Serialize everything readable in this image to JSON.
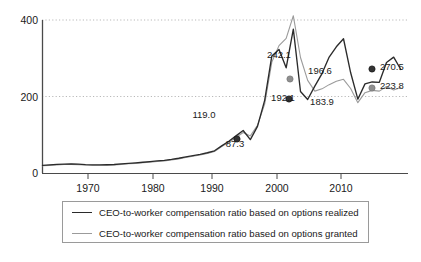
{
  "chart_data": {
    "type": "line",
    "title": "",
    "subtitle": "",
    "xlabel": "",
    "ylabel": "",
    "xlim": [
      1965,
      2016
    ],
    "ylim": [
      0,
      420
    ],
    "yticks": [
      0,
      200,
      400
    ],
    "ytick_labels": [
      "0",
      "200",
      "400"
    ],
    "xticks": [
      1970,
      1980,
      1990,
      2000,
      2010
    ],
    "xtick_labels": [
      "1970",
      "1980",
      "1990",
      "2000",
      "2010"
    ],
    "grid": "horizontal-dotted",
    "legend_position": "bottom",
    "series": [
      {
        "name": "CEO-to-worker compensation ratio based on options realized",
        "color": "#2b2b2b",
        "x": [
          1965,
          1966,
          1967,
          1968,
          1969,
          1970,
          1971,
          1972,
          1973,
          1974,
          1975,
          1976,
          1977,
          1978,
          1979,
          1980,
          1981,
          1982,
          1983,
          1984,
          1985,
          1986,
          1987,
          1988,
          1989,
          1990,
          1991,
          1992,
          1993,
          1994,
          1995,
          1996,
          1997,
          1998,
          1999,
          2000,
          2001,
          2002,
          2003,
          2004,
          2005,
          2006,
          2007,
          2008,
          2009,
          2010,
          2011,
          2012,
          2013,
          2014,
          2015
        ],
        "values": [
          20.0,
          21.2,
          22.4,
          23.4,
          23.8,
          23.0,
          22.0,
          21.4,
          21.2,
          21.6,
          22.2,
          23.8,
          25.0,
          26.4,
          28.0,
          29.8,
          31.5,
          33.0,
          35.5,
          38.5,
          42.0,
          45.5,
          48.5,
          53.0,
          58.0,
          71.0,
          83.0,
          97.0,
          111.0,
          87.3,
          122.0,
          190.0,
          306.0,
          323.0,
          275.0,
          376.0,
          213.0,
          192.1,
          227.0,
          260.0,
          303.0,
          330.0,
          351.0,
          262.0,
          193.0,
          233.0,
          238.0,
          237.0,
          289.0,
          303.0,
          270.5
        ]
      },
      {
        "name": "CEO-to-worker compensation ratio based on options granted",
        "color": "#9b9b9b",
        "x": [
          1965,
          1966,
          1967,
          1968,
          1969,
          1970,
          1971,
          1972,
          1973,
          1974,
          1975,
          1976,
          1977,
          1978,
          1979,
          1980,
          1981,
          1982,
          1983,
          1984,
          1985,
          1986,
          1987,
          1988,
          1989,
          1990,
          1991,
          1992,
          1993,
          1994,
          1995,
          1996,
          1997,
          1998,
          1999,
          2000,
          2001,
          2002,
          2003,
          2004,
          2005,
          2006,
          2007,
          2008,
          2009,
          2010,
          2011,
          2012,
          2013,
          2014,
          2015
        ],
        "values": [
          19.0,
          20.0,
          21.2,
          22.2,
          22.6,
          21.8,
          20.8,
          20.4,
          20.2,
          20.6,
          21.2,
          22.6,
          24.0,
          25.2,
          26.8,
          28.4,
          30.2,
          31.8,
          34.2,
          37.0,
          40.5,
          44.0,
          47.0,
          51.0,
          56.0,
          69.0,
          80.0,
          93.0,
          106.0,
          97.0,
          125.0,
          180.0,
          290.0,
          333.0,
          352.0,
          411.0,
          302.0,
          242.1,
          214.0,
          220.0,
          231.0,
          240.0,
          245.0,
          221.0,
          183.9,
          210.0,
          216.0,
          214.0,
          226.0,
          217.0,
          223.8
        ]
      }
    ],
    "annotations": [
      {
        "label": "119.0",
        "x": 1993,
        "y": 119.0,
        "px": 204,
        "py": 118,
        "series": "granted"
      },
      {
        "label": "87.3",
        "x": 1994,
        "y": 87.3,
        "px": 235,
        "py": 147,
        "series": "realized",
        "marker": true,
        "marker_px": 237,
        "marker_py": 139
      },
      {
        "label": "242.1",
        "x": 2002,
        "y": 242.1,
        "px": 279,
        "py": 58,
        "series": "granted",
        "marker": true,
        "marker_px": 290,
        "marker_py": 79
      },
      {
        "label": "192.1",
        "x": 2002,
        "y": 192.1,
        "px": 283,
        "py": 101,
        "series": "realized",
        "marker": true,
        "marker_px": 289,
        "marker_py": 99
      },
      {
        "label": "196.6",
        "x": 2007,
        "y": 196.6,
        "px": 320,
        "py": 74,
        "series": "granted"
      },
      {
        "label": "183.9",
        "x": 2009,
        "y": 183.9,
        "px": 322,
        "py": 105,
        "series": "granted"
      },
      {
        "label": "270.5",
        "x": 2015,
        "y": 270.5,
        "px": 380,
        "py": 70,
        "series": "realized",
        "marker": true,
        "marker_px": 372,
        "marker_py": 69
      },
      {
        "label": "223.8",
        "x": 2015,
        "y": 223.8,
        "px": 380,
        "py": 89,
        "series": "granted",
        "marker": true,
        "marker_px": 372,
        "marker_py": 88
      }
    ]
  },
  "axes": {
    "y_ticks": [
      "400",
      "200",
      "0"
    ],
    "x_ticks": [
      "1970",
      "1980",
      "1990",
      "2000",
      "2010"
    ]
  },
  "legend": {
    "items": [
      {
        "label": "CEO-to-worker compensation ratio based on options realized",
        "style": "realized"
      },
      {
        "label": "CEO-to-worker compensation ratio based on options granted",
        "style": "granted"
      }
    ]
  },
  "colors": {
    "realized": "#2b2b2b",
    "granted": "#9b9b9b",
    "axis": "#4a4a4a",
    "grid": "#b9b9b9",
    "legend_border": "#9a9a9a",
    "background": "#ffffff"
  }
}
